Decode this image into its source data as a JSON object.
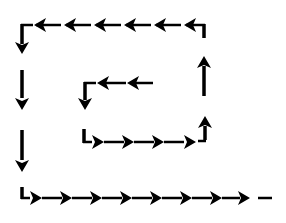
{
  "diagram": {
    "stroke_color": "#000000",
    "background_color": "#ffffff",
    "segments": [
      {
        "name": "bottom-row",
        "direction": "right",
        "arrow_count": 8,
        "ends_with": "dash"
      },
      {
        "name": "right-column-lower",
        "direction": "up",
        "arrow_count": 1
      },
      {
        "name": "right-column-upper",
        "direction": "up",
        "arrow_count": 1
      },
      {
        "name": "top-row",
        "direction": "left",
        "arrow_count": 6
      },
      {
        "name": "left-column",
        "direction": "down",
        "arrow_count": 3
      },
      {
        "name": "inner-bottom-row",
        "direction": "right",
        "arrow_count": 4
      },
      {
        "name": "inner-top-row",
        "direction": "left",
        "arrow_count": 2
      },
      {
        "name": "inner-left-column",
        "direction": "down",
        "arrow_count": 1
      }
    ]
  }
}
